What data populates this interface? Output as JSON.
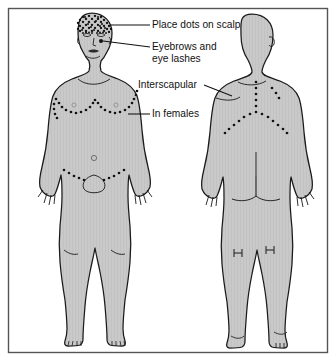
{
  "figure": {
    "frame": {
      "border_color": "#555555",
      "background_color": "#ffffff"
    },
    "palette": {
      "body_fill": "#c9c9c9",
      "body_outline": "#1a1a1a",
      "dot_color": "#111111",
      "label_color": "#111111",
      "leader_color": "#111111"
    },
    "views": [
      {
        "name": "anterior",
        "label": "front view"
      },
      {
        "name": "posterior",
        "label": "back view"
      }
    ],
    "annotations": [
      {
        "id": "scalp",
        "text": "Place dots on scalp",
        "target": "scalp",
        "view": "anterior"
      },
      {
        "id": "eyebrows",
        "text": "Eyebrows and",
        "text_line2": "eye lashes",
        "target": "eyebrows-eyelashes",
        "view": "anterior"
      },
      {
        "id": "interscapular",
        "text": "Interscapular",
        "target": "interscapular",
        "view": "posterior"
      },
      {
        "id": "in-females",
        "text": "In females",
        "target": "inframammary",
        "view": "anterior"
      }
    ],
    "dot_regions": [
      {
        "id": "scalp",
        "description": "dense stipple over scalp",
        "view": "anterior"
      },
      {
        "id": "eyebrows-eyelashes",
        "description": "eyebrow and lash dots",
        "view": "anterior"
      },
      {
        "id": "inframammary",
        "description": "curved dot lines beneath breasts",
        "view": "anterior"
      },
      {
        "id": "suprapubic",
        "description": "V-shaped dot lines above pubis",
        "view": "anterior"
      },
      {
        "id": "interscapular",
        "description": "Y-shaped dot pattern between scapulae",
        "view": "posterior"
      }
    ]
  }
}
